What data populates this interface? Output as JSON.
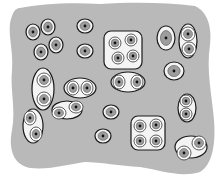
{
  "diagram": {
    "colors": {
      "background": "#ffffff",
      "matrix": "#b9b9b9",
      "capsule_fill": "#f4f4f4",
      "capsule_stroke": "#1a1a1a",
      "cell_fill": "#9d9d9d",
      "nucleus": "#111111"
    },
    "groups": [
      {
        "type": "single",
        "cells": [
          [
            33,
            32,
            7,
            8
          ]
        ]
      },
      {
        "type": "single",
        "cells": [
          [
            48,
            27,
            7,
            8
          ]
        ]
      },
      {
        "type": "single",
        "cells": [
          [
            41,
            52,
            7,
            8
          ]
        ]
      },
      {
        "type": "single",
        "cells": [
          [
            56,
            45,
            7,
            8
          ]
        ]
      },
      {
        "type": "single",
        "cells": [
          [
            85,
            26,
            8,
            7
          ]
        ]
      },
      {
        "type": "single",
        "cells": [
          [
            85,
            51,
            8,
            7
          ]
        ]
      },
      {
        "type": "pair",
        "capsule": [
          43,
          89,
          11,
          21
        ],
        "cells": [
          [
            44,
            80,
            7,
            7
          ],
          [
            44,
            99,
            7,
            7
          ]
        ]
      },
      {
        "type": "pair",
        "capsule": [
          80,
          88,
          16,
          10
        ],
        "cells": [
          [
            73,
            88,
            6,
            7
          ],
          [
            87,
            88,
            6,
            7
          ]
        ]
      },
      {
        "type": "quad",
        "capsule": [
          123,
          50,
          19,
          19,
          7
        ],
        "cells": [
          [
            115,
            43,
            6,
            6
          ],
          [
            131,
            40,
            6,
            6
          ],
          [
            118,
            58,
            6,
            6
          ],
          [
            133,
            56,
            6,
            6
          ]
        ]
      },
      {
        "type": "single",
        "cells": [
          [
            166,
            38,
            9,
            12
          ]
        ]
      },
      {
        "type": "pair",
        "capsule": [
          188,
          41,
          9,
          17
        ],
        "cells": [
          [
            188,
            34,
            7,
            7
          ],
          [
            189,
            49,
            7,
            7
          ]
        ]
      },
      {
        "type": "pair",
        "capsule": [
          128,
          82,
          17,
          10
        ],
        "cells": [
          [
            119,
            82,
            6,
            7
          ],
          [
            137,
            82,
            6,
            7
          ]
        ]
      },
      {
        "type": "single",
        "cells": [
          [
            174,
            71,
            10,
            9
          ]
        ]
      },
      {
        "type": "single",
        "cells": [
          [
            111,
            112,
            8,
            7
          ]
        ]
      },
      {
        "type": "pair",
        "capsule": [
          187,
          108,
          9,
          14
        ],
        "cells": [
          [
            186,
            101,
            6,
            6
          ],
          [
            186,
            114,
            6,
            6
          ]
        ]
      },
      {
        "type": "pair",
        "capsule": [
          33,
          126,
          10,
          17
        ],
        "cells": [
          [
            30,
            118,
            6,
            7
          ],
          [
            36,
            134,
            6,
            7
          ]
        ]
      },
      {
        "type": "pair",
        "capsule": [
          67,
          110,
          15,
          9
        ],
        "cells": [
          [
            59,
            113,
            7,
            6
          ],
          [
            76,
            107,
            7,
            6
          ]
        ]
      },
      {
        "type": "single",
        "cells": [
          [
            103,
            136,
            8,
            7
          ]
        ]
      },
      {
        "type": "quad",
        "capsule": [
          148,
          133,
          17,
          17,
          7
        ],
        "cells": [
          [
            140,
            126,
            6,
            6
          ],
          [
            156,
            125,
            6,
            6
          ],
          [
            140,
            141,
            6,
            6
          ],
          [
            156,
            141,
            6,
            6
          ]
        ]
      },
      {
        "type": "pair",
        "capsule": [
          191,
          147,
          16,
          11
        ],
        "cells": [
          [
            184,
            153,
            7,
            7
          ],
          [
            199,
            143,
            7,
            7
          ]
        ]
      }
    ]
  }
}
